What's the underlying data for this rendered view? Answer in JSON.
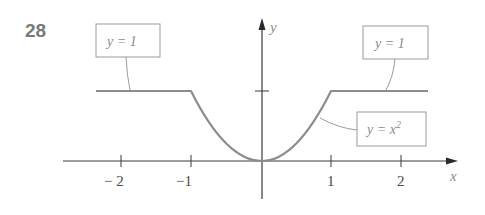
{
  "problem_number": "28",
  "axes": {
    "x_label": "x",
    "y_label": "y",
    "x_ticks": [
      {
        "value": -2,
        "label": "− 2"
      },
      {
        "value": -1,
        "label": "−1"
      },
      {
        "value": 1,
        "label": "1"
      },
      {
        "value": 2,
        "label": "2"
      }
    ],
    "y_ticks": [
      {
        "value": 1,
        "label": ""
      }
    ]
  },
  "annotations": {
    "left_box": "y = 1",
    "right_box": "y = 1",
    "parabola_box_prefix": "y = x",
    "parabola_box_exponent": "2"
  },
  "colors": {
    "curve": "#8c8c8c",
    "axis": "#3a3a3a",
    "label_box_border": "#9a9a9a",
    "problem_number": "#7a7a7a"
  },
  "function": {
    "description": "Piecewise: y = 1 for |x| >= 1, y = x^2 for |x| < 1",
    "pieces": [
      {
        "domain": [
          -2.4,
          -1
        ],
        "expr": "1"
      },
      {
        "domain": [
          -1,
          1
        ],
        "expr": "x^2"
      },
      {
        "domain": [
          1,
          2.4
        ],
        "expr": "1"
      }
    ]
  }
}
